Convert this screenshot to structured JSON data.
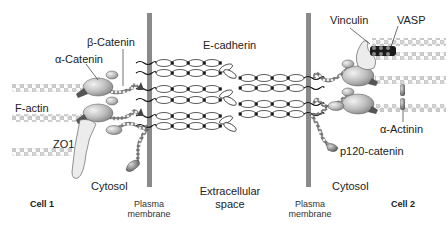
{
  "diagram": {
    "type": "adherens-junction-schematic",
    "labels": {
      "beta_catenin": "β-Catenin",
      "alpha_catenin": "α-Catenin",
      "e_cadherin": "E-cadherin",
      "vinculin": "Vinculin",
      "vasp": "VASP",
      "f_actin": "F-actin",
      "zo1": "ZO1",
      "alpha_actinin": "α-Actinin",
      "p120_catenin": "p120-catenin",
      "cytosol_left": "Cytosol",
      "cytosol_right": "Cytosol",
      "extracellular_line1": "Extracellular",
      "extracellular_line2": "space",
      "plasma_membrane_left_line1": "Plasma",
      "plasma_membrane_left_line2": "membrane",
      "plasma_membrane_right_line1": "Plasma",
      "plasma_membrane_right_line2": "membrane",
      "cell1": "Cell 1",
      "cell2": "Cell 2"
    },
    "colors": {
      "membrane": "#8a8a8a",
      "protein_fill": "#bdbdbd",
      "actin": "#cfcfcf",
      "vasp": "#1a1a1a",
      "line": "#222222"
    }
  }
}
